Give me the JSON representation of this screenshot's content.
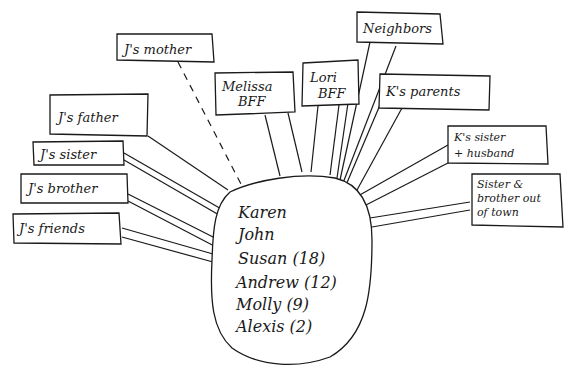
{
  "diagram": {
    "type": "ecomap",
    "center": {
      "members": [
        "Karen",
        "John",
        "Susan (18)",
        "Andrew (12)",
        "Molly (9)",
        "Alexis (2)"
      ]
    },
    "nodes": [
      {
        "id": "j-mother",
        "label": "J's mother",
        "connection": "dashed"
      },
      {
        "id": "j-father",
        "label": "J's father",
        "connection": "single"
      },
      {
        "id": "j-sister",
        "label": "J's sister",
        "connection": "double"
      },
      {
        "id": "j-brother",
        "label": "J's brother",
        "connection": "double"
      },
      {
        "id": "j-friends",
        "label": "J's friends",
        "connection": "double"
      },
      {
        "id": "melissa",
        "label_lines": [
          "Melissa",
          "BFF"
        ],
        "connection": "double"
      },
      {
        "id": "lori",
        "label_lines": [
          "Lori",
          "BFF"
        ],
        "connection": "triple"
      },
      {
        "id": "neighbors",
        "label": "Neighbors",
        "connection": "double"
      },
      {
        "id": "k-parents",
        "label": "K's parents",
        "connection": "double"
      },
      {
        "id": "k-sister",
        "label_lines": [
          "K's sister",
          "+ husband"
        ],
        "connection": "double"
      },
      {
        "id": "sib-out",
        "label_lines": [
          "Sister &",
          "brother out",
          "of town"
        ],
        "connection": "double"
      }
    ],
    "colors": {
      "ink": "#1a1a1a",
      "paper": "#ffffff"
    }
  }
}
